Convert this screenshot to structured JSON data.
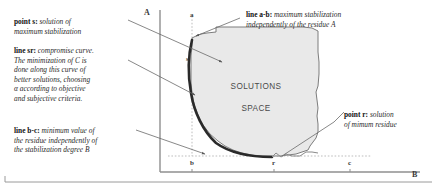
{
  "figure": {
    "type": "diagram",
    "background_color": "#ffffff",
    "ink_color": "#2b2b2b",
    "fill_color": "#e8e8e8"
  },
  "axes": {
    "y_label": "A",
    "x_label": "B",
    "y_axis_color": "#8a8a8a",
    "x_axis_color": "#8a8a8a"
  },
  "point_labels": [
    {
      "id": "a",
      "text": "a"
    },
    {
      "id": "s",
      "text": "s"
    },
    {
      "id": "b",
      "text": "b"
    },
    {
      "id": "r",
      "text": "r"
    },
    {
      "id": "c",
      "text": "c"
    }
  ],
  "region": {
    "label_line1": "SOLUTIONS",
    "label_line2": "SPACE"
  },
  "annotations": [
    {
      "id": "point-s",
      "lead": "point s",
      "separator": ":",
      "lines": [
        "solution of",
        "maximum stabilization"
      ]
    },
    {
      "id": "line-sr",
      "lead": "line sr",
      "separator": ":",
      "lines": [
        "compromise curve.",
        "The minimization of C is",
        "done along this curve of",
        "better solutions, choosing",
        "α according to objective",
        "and subjective criteria."
      ]
    },
    {
      "id": "line-bc",
      "lead": "line b-c",
      "separator": ":",
      "lines": [
        "minimum value of",
        "the residue independently of",
        "the stabilization degree B"
      ]
    },
    {
      "id": "line-ab",
      "lead": "line a-b",
      "separator": ":",
      "lines": [
        "maximum stabilization",
        "independently of the residue A"
      ]
    },
    {
      "id": "point-r",
      "lead": "point r",
      "separator": ":",
      "lines": [
        "solution",
        "of mimum residue"
      ]
    }
  ]
}
